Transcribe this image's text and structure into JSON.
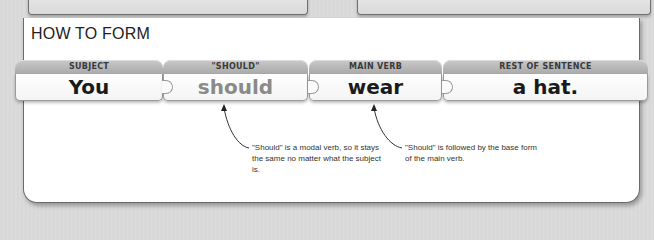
{
  "panel": {
    "title": "HOW TO FORM"
  },
  "pieces": [
    {
      "header": "SUBJECT",
      "word": "You"
    },
    {
      "header": "\"SHOULD\"",
      "word": "should"
    },
    {
      "header": "MAIN VERB",
      "word": "wear"
    },
    {
      "header": "REST OF SENTENCE",
      "word": "a hat."
    }
  ],
  "annotations": [
    {
      "text": "\"Should\" is a modal verb, so it stays the same no matter what the subject is.",
      "points_to": "should"
    },
    {
      "text": "\"Should\" is followed by the base form of the main verb.",
      "points_to": "wear"
    }
  ],
  "colors": {
    "header_gray": "#b5b5b5",
    "modal_word": "#8a8a8a",
    "text_dark": "#1a1a1a"
  }
}
